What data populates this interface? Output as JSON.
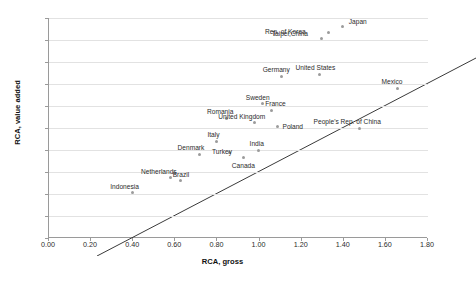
{
  "chart_data": {
    "type": "scatter",
    "title": "",
    "xlabel": "RCA, gross",
    "ylabel": "RCA, value added",
    "xlim": [
      0.0,
      1.8
    ],
    "ylim": [
      0.0,
      2.0
    ],
    "xticks": [
      "0.00",
      "0.20",
      "0.40",
      "0.60",
      "0.80",
      "1.00",
      "1.20",
      "1.40",
      "1.60",
      "1.80"
    ],
    "yticks": [
      "0.00",
      "0.20",
      "0.40",
      "0.60",
      "0.80",
      "1.00",
      "1.20",
      "1.40",
      "1.60",
      "1.80",
      "2.00"
    ],
    "grid": "horizontal",
    "legend": "none",
    "reference_line": {
      "label": "45-degree line",
      "from": [
        0.0,
        0.0
      ],
      "to": [
        1.8,
        1.8
      ]
    },
    "points": [
      {
        "label": "Japan",
        "x": 1.4,
        "y": 1.92,
        "label_dx": 6,
        "label_dy": -9
      },
      {
        "label": "Rep. of Korea",
        "x": 1.33,
        "y": 1.87,
        "label_dx": -63,
        "label_dy": -4
      },
      {
        "label": "Taipei,China",
        "x": 1.3,
        "y": 1.81,
        "label_dx": -50,
        "label_dy": -9
      },
      {
        "label": "United States",
        "x": 1.29,
        "y": 1.49,
        "label_dx": -24,
        "label_dy": -10
      },
      {
        "label": "Germany",
        "x": 1.11,
        "y": 1.47,
        "label_dx": -19,
        "label_dy": -10
      },
      {
        "label": "Mexico",
        "x": 1.66,
        "y": 1.36,
        "label_dx": -16,
        "label_dy": -10
      },
      {
        "label": "Sweden",
        "x": 1.02,
        "y": 1.22,
        "label_dx": -17,
        "label_dy": -10
      },
      {
        "label": "France",
        "x": 1.06,
        "y": 1.16,
        "label_dx": -6,
        "label_dy": -10
      },
      {
        "label": "Romania",
        "x": 0.85,
        "y": 1.09,
        "label_dx": -20,
        "label_dy": -10
      },
      {
        "label": "United Kingdom",
        "x": 0.98,
        "y": 1.05,
        "label_dx": -36,
        "label_dy": -10
      },
      {
        "label": "Poland",
        "x": 1.09,
        "y": 1.01,
        "label_dx": 5,
        "label_dy": -4
      },
      {
        "label": "People's Rep. of China",
        "x": 1.48,
        "y": 1.0,
        "label_dx": -46,
        "label_dy": -10
      },
      {
        "label": "Italy",
        "x": 0.8,
        "y": 0.88,
        "label_dx": -9,
        "label_dy": -10
      },
      {
        "label": "India",
        "x": 1.0,
        "y": 0.8,
        "label_dx": -9,
        "label_dy": -10
      },
      {
        "label": "Turkey",
        "x": 0.86,
        "y": 0.78,
        "label_dx": -17,
        "label_dy": -4
      },
      {
        "label": "Denmark",
        "x": 0.72,
        "y": 0.76,
        "label_dx": -22,
        "label_dy": -10
      },
      {
        "label": "Canada",
        "x": 0.93,
        "y": 0.73,
        "label_dx": -12,
        "label_dy": 4
      },
      {
        "label": "Netherlands",
        "x": 0.58,
        "y": 0.55,
        "label_dx": -29,
        "label_dy": -10
      },
      {
        "label": "Brazil",
        "x": 0.63,
        "y": 0.52,
        "label_dx": -8,
        "label_dy": -10
      },
      {
        "label": "Indonesia",
        "x": 0.4,
        "y": 0.41,
        "label_dx": -22,
        "label_dy": -10
      }
    ]
  }
}
